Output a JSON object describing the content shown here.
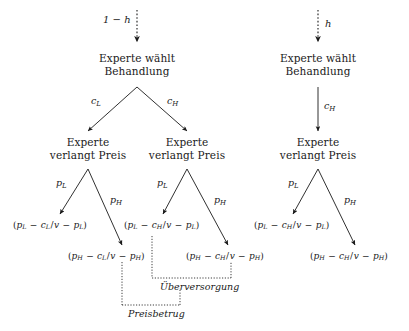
{
  "figure": {
    "type": "game-tree",
    "title": "",
    "background_color": "#ffffff",
    "ink_color": "#1a1a1a"
  },
  "chance": {
    "left_branch_label_prefix": "1",
    "left_branch_label_op": "−",
    "left_branch_label_var": "h",
    "right_branch_label_var": "h"
  },
  "nodes": {
    "treatment_left": {
      "line1": "Experte wählt",
      "line2": "Behandlung"
    },
    "treatment_right": {
      "line1": "Experte wählt",
      "line2": "Behandlung"
    },
    "price_left": {
      "line1": "Experte",
      "line2": "verlangt Preis"
    },
    "price_mid": {
      "line1": "Experte",
      "line2": "verlangt Preis"
    },
    "price_right": {
      "line1": "Experte",
      "line2": "verlangt Preis"
    }
  },
  "edges": {
    "cost_low": {
      "base": "c",
      "sub": "L"
    },
    "cost_high_left": {
      "base": "c",
      "sub": "H"
    },
    "cost_high_right": {
      "base": "c",
      "sub": "H"
    },
    "price_low_1": {
      "base": "p",
      "sub": "L"
    },
    "price_high_1": {
      "base": "p",
      "sub": "H"
    },
    "price_low_2": {
      "base": "p",
      "sub": "L"
    },
    "price_high_2": {
      "base": "p",
      "sub": "H"
    },
    "price_low_3": {
      "base": "p",
      "sub": "L"
    },
    "price_high_3": {
      "base": "p",
      "sub": "H"
    }
  },
  "payoffs": [
    {
      "id": "payoff-ll",
      "text": "(p_L − c_L/v − p_L)",
      "parts": {
        "p1": "p",
        "p1sub": "L",
        "c": "c",
        "csub": "L",
        "v": "v",
        "p2": "p",
        "p2sub": "L"
      }
    },
    {
      "id": "payoff-lh",
      "text": "(p_H − c_L/v − p_H)",
      "parts": {
        "p1": "p",
        "p1sub": "H",
        "c": "c",
        "csub": "L",
        "v": "v",
        "p2": "p",
        "p2sub": "H"
      }
    },
    {
      "id": "payoff-hl",
      "text": "(p_L − c_H/v − p_L)",
      "parts": {
        "p1": "p",
        "p1sub": "L",
        "c": "c",
        "csub": "H",
        "v": "v",
        "p2": "p",
        "p2sub": "L"
      }
    },
    {
      "id": "payoff-hh",
      "text": "(p_H − c_H/v − p_H)",
      "parts": {
        "p1": "p",
        "p1sub": "H",
        "c": "c",
        "csub": "H",
        "v": "v",
        "p2": "p",
        "p2sub": "H"
      }
    },
    {
      "id": "payoff-rl",
      "text": "(p_L − c_H/v − p_L)",
      "parts": {
        "p1": "p",
        "p1sub": "L",
        "c": "c",
        "csub": "H",
        "v": "v",
        "p2": "p",
        "p2sub": "L"
      }
    },
    {
      "id": "payoff-rh",
      "text": "(p_H − c_H/v − p_H)",
      "parts": {
        "p1": "p",
        "p1sub": "H",
        "c": "c",
        "csub": "H",
        "v": "v",
        "p2": "p",
        "p2sub": "H"
      }
    }
  ],
  "annotations": {
    "overtreatment": "Überversorgung",
    "overcharging": "Preisbetrug"
  },
  "symbols": {
    "minus": "−",
    "slash": "/",
    "lparen": "(",
    "rparen": ")"
  }
}
